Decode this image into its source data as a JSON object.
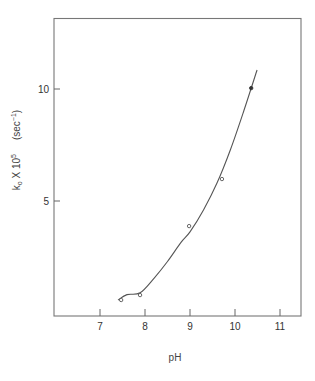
{
  "chart_data": {
    "type": "scatter",
    "title": "",
    "xlabel": "pH",
    "ylabel": {
      "base": "k",
      "subscript": "o",
      "multiplier": " X 10",
      "exponent": "5",
      "units_open": "(sec",
      "units_exponent": "−1",
      "units_close": ")"
    },
    "xlim": [
      6.0,
      11.5
    ],
    "ylim": [
      0,
      13.2
    ],
    "xticks": [
      7,
      8,
      9,
      10,
      11
    ],
    "xtick_labels": [
      "7",
      "8",
      "9",
      "10",
      "11"
    ],
    "yticks": [
      5,
      10
    ],
    "ytick_labels": [
      "5",
      "10"
    ],
    "grid": false,
    "legend": "none",
    "series": [
      {
        "name": "observed (open circles)",
        "marker": "open-circle",
        "x": [
          7.47,
          7.89,
          8.98,
          9.71
        ],
        "y": [
          0.58,
          0.8,
          3.88,
          5.98
        ]
      },
      {
        "name": "observed (filled circle)",
        "marker": "filled-circle",
        "x": [
          10.36
        ],
        "y": [
          10.04
        ]
      },
      {
        "name": "fitted curve",
        "marker": "line",
        "x": [
          7.4,
          7.6,
          7.89,
          8.2,
          8.5,
          8.8,
          9.0,
          9.3,
          9.6,
          9.9,
          10.2,
          10.49
        ],
        "y": [
          0.58,
          0.82,
          0.9,
          1.55,
          2.3,
          3.15,
          3.62,
          4.6,
          5.8,
          7.3,
          9.05,
          10.85
        ]
      }
    ]
  }
}
